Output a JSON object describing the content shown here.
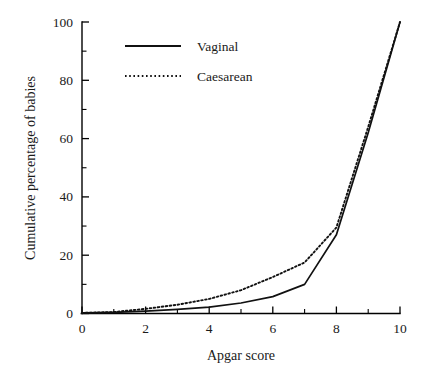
{
  "chart_data": {
    "type": "line",
    "title": "",
    "xlabel": "Apgar score",
    "ylabel": "Cumulative percentage of babies",
    "xlim": [
      0,
      10
    ],
    "ylim": [
      0,
      100
    ],
    "grid": false,
    "legend_position": "top-left",
    "x_ticks_major": [
      0,
      2,
      4,
      6,
      8,
      10
    ],
    "x_ticks_minor": [
      1,
      3,
      5,
      7,
      9
    ],
    "y_ticks_major": [
      0,
      20,
      40,
      60,
      80,
      100
    ],
    "y_ticks_minor": [
      10,
      30,
      50,
      70,
      90
    ],
    "x_tick_labels": [
      "0",
      "2",
      "4",
      "6",
      "8",
      "10"
    ],
    "y_tick_labels": [
      "0",
      "20",
      "40",
      "60",
      "80",
      "100"
    ],
    "x": [
      0,
      1,
      2,
      3,
      4,
      5,
      6,
      7,
      8,
      9,
      10
    ],
    "series": [
      {
        "name": "Vaginal",
        "style": "solid",
        "values": [
          0.2,
          0.4,
          0.8,
          1.4,
          2.2,
          3.6,
          5.8,
          10.0,
          27.0,
          62.0,
          100.0
        ]
      },
      {
        "name": "Caesarean",
        "style": "dotted",
        "values": [
          0.2,
          0.5,
          1.6,
          3.0,
          5.0,
          8.0,
          12.5,
          17.5,
          29.5,
          64.0,
          100.0
        ]
      }
    ]
  },
  "axes": {
    "x_title": "Apgar score",
    "y_title": "Cumulative percentage of babies"
  },
  "legend": {
    "entries": [
      {
        "label": "Vaginal",
        "style": "solid"
      },
      {
        "label": "Caesarean",
        "style": "dotted"
      }
    ]
  },
  "colors": {
    "ink": "#111111",
    "background": "#ffffff"
  }
}
